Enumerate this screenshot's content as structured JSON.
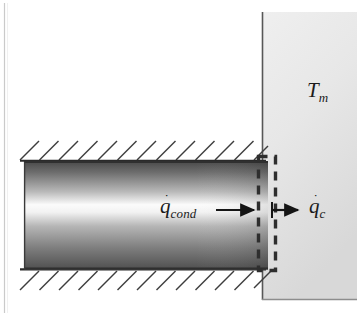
{
  "figure": {
    "background_color": "#ffffff",
    "ink_color": "#1b1b1b"
  },
  "labels": {
    "wall_temperature": {
      "id": "T_m",
      "base": "T",
      "subscript": "m",
      "has_dot": false,
      "x": 307,
      "y": 80
    },
    "conduction_flux": {
      "id": "q_cond",
      "base": "q",
      "subscript": "cond",
      "has_dot": true,
      "dot": "˙",
      "x": 160,
      "y": 196
    },
    "convection_flux": {
      "id": "q_c",
      "base": "q",
      "subscript": "c",
      "has_dot": true,
      "dot": "˙",
      "x": 309,
      "y": 196
    }
  },
  "geometry": {
    "rod": {
      "x": 24,
      "y": 161,
      "width": 244,
      "height": 104,
      "gradient_stops": [
        {
          "offset": 0.0,
          "color": "#4a4a4a"
        },
        {
          "offset": 0.1,
          "color": "#6d6d6d"
        },
        {
          "offset": 0.28,
          "color": "#b9b9b9"
        },
        {
          "offset": 0.4,
          "color": "#fbfbfb"
        },
        {
          "offset": 0.47,
          "color": "#f2f2f2"
        },
        {
          "offset": 0.6,
          "color": "#b5b5b5"
        },
        {
          "offset": 0.8,
          "color": "#7e7e7e"
        },
        {
          "offset": 1.0,
          "color": "#4f4f4f"
        }
      ]
    },
    "wall": {
      "x": 262,
      "y": 12,
      "width": 95,
      "height": 288,
      "fill_top": "#ececec",
      "fill_bottom": "#dcdcdc",
      "edge_color": "#5a5a5a"
    },
    "hatching": {
      "count_top": 13,
      "count_bottom": 13,
      "spacing": 19.5,
      "angle_deg": 45,
      "length": 26,
      "color": "#3d3d3d"
    },
    "control_volume": {
      "x": 258,
      "y": 156,
      "width": 17,
      "height": 114,
      "stroke_dash": "9 7",
      "stroke_width": 3.4,
      "color": "#2e2e2e"
    },
    "arrow_conduction": {
      "x1": 216,
      "x2": 258,
      "y": 210,
      "color": "#151515"
    },
    "arrow_convection": {
      "x1": 272,
      "x2": 302,
      "y": 210,
      "color": "#151515"
    },
    "page_edge_line": {
      "x": 4.5,
      "y1": 4,
      "y2": 312,
      "color": "#c9c9c9"
    }
  }
}
